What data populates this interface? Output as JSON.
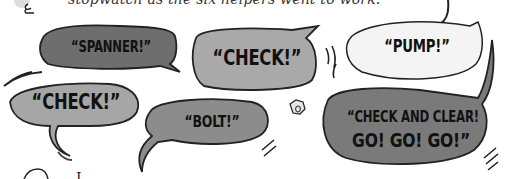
{
  "caption": "stopwatch as the six helpers went to work.",
  "bottom_text": "I ...",
  "bubbles": [
    {
      "id": "spanner",
      "text": "“SPANNER!”",
      "fill": "#6e6e6e"
    },
    {
      "id": "check-top",
      "text": "“CHECK!”",
      "fill": "#a9a9a9"
    },
    {
      "id": "pump",
      "text": "“PUMP!”",
      "fill": "#f4f4f4"
    },
    {
      "id": "check-left",
      "text": "“CHECK!”",
      "fill": "#a6a6a6"
    },
    {
      "id": "bolt",
      "text": "“BOLT!”",
      "fill": "#8c8c8c"
    },
    {
      "id": "check-and-clear",
      "line1": "“CHECK AND CLEAR!",
      "line2": "GO! GO! GO!”",
      "fill": "#7a7a7a"
    }
  ],
  "icons": {
    "bolt_nut": "hex-nut-icon",
    "stopwatch": "stopwatch-icon",
    "character": "character-icon"
  }
}
